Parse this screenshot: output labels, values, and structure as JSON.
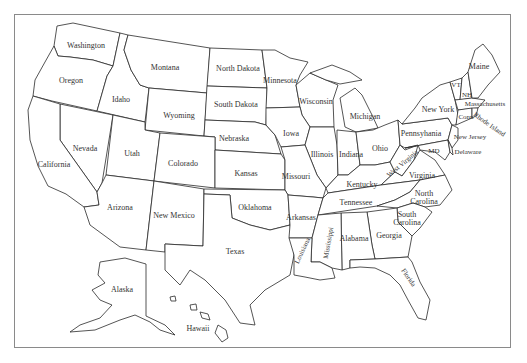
{
  "map": {
    "title": "United States",
    "style": "outline",
    "colors": {
      "background": "#ffffff",
      "stroke": "#2a2a2a",
      "frame": "#8a8a8a",
      "label": "#333333"
    },
    "states": [
      {
        "name": "Washington",
        "x": 86,
        "y": 46
      },
      {
        "name": "Oregon",
        "x": 71,
        "y": 81
      },
      {
        "name": "Idaho",
        "x": 121,
        "y": 100
      },
      {
        "name": "Montana",
        "x": 165,
        "y": 68
      },
      {
        "name": "Wyoming",
        "x": 179,
        "y": 116
      },
      {
        "name": "North Dakota",
        "x": 238,
        "y": 69
      },
      {
        "name": "South Dakota",
        "x": 236,
        "y": 105
      },
      {
        "name": "Minnesota",
        "x": 277,
        "y": 81
      },
      {
        "name": "Wisconsin",
        "x": 316,
        "y": 102
      },
      {
        "name": "Michigan",
        "x": 365,
        "y": 117
      },
      {
        "name": "Nebraska",
        "x": 234,
        "y": 139
      },
      {
        "name": "Iowa",
        "x": 291,
        "y": 134
      },
      {
        "name": "Illinois",
        "x": 322,
        "y": 155
      },
      {
        "name": "Indiana",
        "x": 351,
        "y": 155
      },
      {
        "name": "Ohio",
        "x": 380,
        "y": 149
      },
      {
        "name": "Nevada",
        "x": 85,
        "y": 149
      },
      {
        "name": "Utah",
        "x": 132,
        "y": 154
      },
      {
        "name": "Colorado",
        "x": 183,
        "y": 164
      },
      {
        "name": "Kansas",
        "x": 246,
        "y": 174
      },
      {
        "name": "Missouri",
        "x": 296,
        "y": 177
      },
      {
        "name": "Kentucky",
        "x": 362,
        "y": 185
      },
      {
        "name": "West Virginia",
        "x": 403,
        "y": 164,
        "rotate": -40
      },
      {
        "name": "Virginia",
        "x": 420,
        "y": 175
      },
      {
        "name": "California",
        "x": 54,
        "y": 165
      },
      {
        "name": "Arizona",
        "x": 120,
        "y": 208
      },
      {
        "name": "New Mexico",
        "x": 174,
        "y": 216
      },
      {
        "name": "Oklahoma",
        "x": 255,
        "y": 208
      },
      {
        "name": "Arkansas",
        "x": 301,
        "y": 218
      },
      {
        "name": "Tennessee",
        "x": 355,
        "y": 203
      },
      {
        "name": "North Carolina",
        "x": 424,
        "y": 194
      },
      {
        "name": "North Carolina line2",
        "x": 424,
        "y": 201
      },
      {
        "name": "South Carolina",
        "x": 406,
        "y": 215
      },
      {
        "name": "South Carolina line2",
        "x": 406,
        "y": 223
      },
      {
        "name": "Georgia",
        "x": 389,
        "y": 236
      },
      {
        "name": "Alabama",
        "x": 354,
        "y": 239
      },
      {
        "name": "Mississippi",
        "x": 328,
        "y": 242,
        "rotate": -80
      },
      {
        "name": "Louisiana",
        "x": 303,
        "y": 250,
        "rotate": -65
      },
      {
        "name": "Texas",
        "x": 235,
        "y": 252
      },
      {
        "name": "Florida",
        "x": 408,
        "y": 277,
        "rotate": 55
      },
      {
        "name": "Alaska",
        "x": 122,
        "y": 290
      },
      {
        "name": "Hawaii",
        "x": 198,
        "y": 329
      },
      {
        "name": "Maine",
        "x": 479,
        "y": 67
      },
      {
        "name": "VT",
        "x": 456,
        "y": 85
      },
      {
        "name": "NH",
        "x": 467,
        "y": 95
      },
      {
        "name": "New York",
        "x": 438,
        "y": 109
      },
      {
        "name": "Massachusetts",
        "x": 483,
        "y": 104
      },
      {
        "name": "Conn",
        "x": 467,
        "y": 117
      },
      {
        "name": "Rhode Island",
        "x": 488,
        "y": 124,
        "rotate": 35
      },
      {
        "name": "Pennsylvania",
        "x": 421,
        "y": 134
      },
      {
        "name": "New Jersey",
        "x": 468,
        "y": 136
      },
      {
        "name": "MD",
        "x": 433,
        "y": 150
      },
      {
        "name": "Delaware",
        "x": 465,
        "y": 151
      }
    ]
  },
  "labels": {
    "washington": "Washington",
    "oregon": "Oregon",
    "idaho": "Idaho",
    "montana": "Montana",
    "wyoming": "Wyoming",
    "north_dakota": "North Dakota",
    "south_dakota": "South Dakota",
    "minnesota": "Minnesota",
    "wisconsin": "Wisconsin",
    "michigan": "Michigan",
    "nebraska": "Nebraska",
    "iowa": "Iowa",
    "illinois": "Illinois",
    "indiana": "Indiana",
    "ohio": "Ohio",
    "nevada": "Nevada",
    "utah": "Utah",
    "colorado": "Colorado",
    "kansas": "Kansas",
    "missouri": "Missouri",
    "kentucky": "Kentucky",
    "west_virginia": "West Virginia",
    "virginia": "Virginia",
    "california": "California",
    "arizona": "Arizona",
    "new_mexico": "New Mexico",
    "oklahoma": "Oklahoma",
    "arkansas": "Arkansas",
    "tennessee": "Tennessee",
    "north_carolina_1": "North",
    "north_carolina_2": "Carolina",
    "south_carolina_1": "South",
    "south_carolina_2": "Carolina",
    "georgia": "Georgia",
    "alabama": "Alabama",
    "mississippi": "Mississippi",
    "louisiana": "Louisiana",
    "texas": "Texas",
    "florida": "Florida",
    "alaska": "Alaska",
    "hawaii": "Hawaii",
    "maine": "Maine",
    "vermont": "VT",
    "new_hampshire": "NH",
    "new_york": "New York",
    "massachusetts": "Massachusetts",
    "connecticut": "Conn",
    "rhode_island": "Rhode Island",
    "pennsylvania": "Pennsyhania",
    "new_jersey": "New Jersey",
    "maryland": "MD",
    "delaware": "Delaware"
  }
}
